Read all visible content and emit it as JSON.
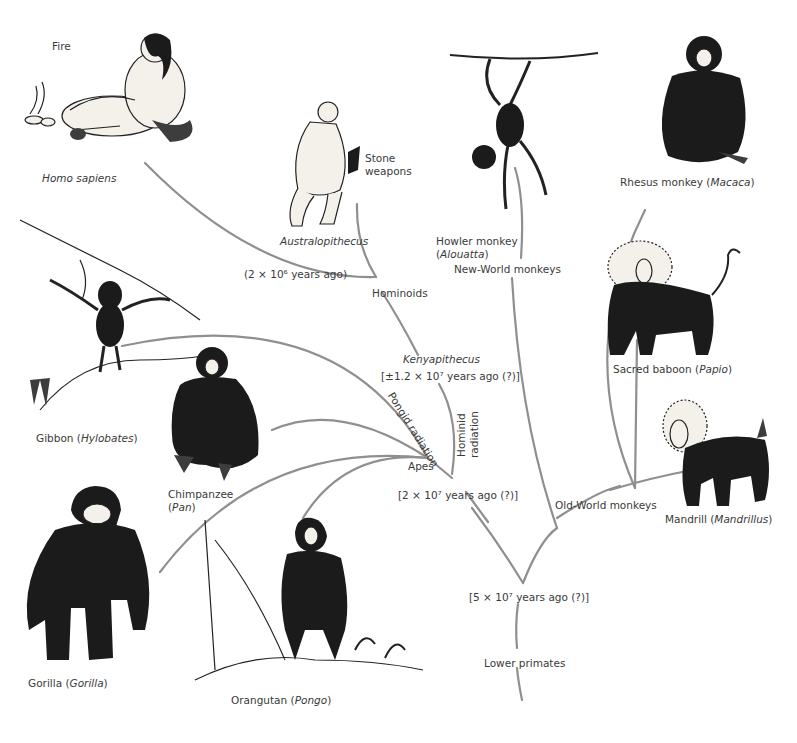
{
  "figure": {
    "colors": {
      "branch": "#8f8f8f",
      "ink": "#1b1b1b",
      "text": "#3a3a3a",
      "background": "#ffffff"
    }
  },
  "nodes": {
    "lower_primates": "Lower primates",
    "root_time": "[5 × 10⁷ years ago (?)]",
    "apes_time": "[2 × 10⁷ years ago (?)]",
    "apes": "Apes",
    "pongid_radiation": "Pongid radiation",
    "hominid_radiation_1": "Hominid",
    "hominid_radiation_2": "radiation",
    "kenyapithecus": "Kenyapithecus",
    "kenyapithecus_time": "[±1.2 × 10⁷ years ago (?)]",
    "hominoids": "Hominoids",
    "homo_time": "(2 × 10⁶ years ago)",
    "old_world": "Old-World monkeys",
    "new_world": "New-World monkeys"
  },
  "species": {
    "homo_sapiens": {
      "common": "",
      "genus": "Homo sapiens"
    },
    "fire": "Fire",
    "australopithecus": {
      "common": "",
      "genus": "Australopithecus"
    },
    "stone_weapons_1": "Stone",
    "stone_weapons_2": "weapons",
    "gibbon": {
      "common": "Gibbon",
      "genus": "Hylobates"
    },
    "chimpanzee": {
      "common": "Chimpanzee",
      "genus": "Pan"
    },
    "gorilla": {
      "common": "Gorilla",
      "genus": "Gorilla"
    },
    "orangutan": {
      "common": "Orangutan",
      "genus": "Pongo"
    },
    "howler": {
      "common": "Howler monkey",
      "genus": "Alouatta"
    },
    "rhesus": {
      "common": "Rhesus monkey",
      "genus": "Macaca"
    },
    "baboon": {
      "common": "Sacred baboon",
      "genus": "Papio"
    },
    "mandrill": {
      "common": "Mandrill",
      "genus": "Mandrillus"
    }
  },
  "punct": {
    "open": " (",
    "close": ")",
    "open_nl": "("
  }
}
